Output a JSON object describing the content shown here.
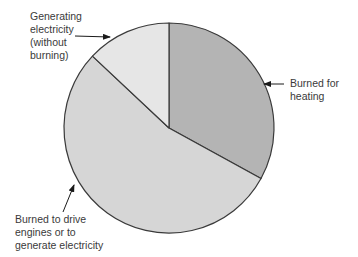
{
  "chart_data": {
    "type": "pie",
    "title": "",
    "categories": [
      "Burned for heating",
      "Burned to drive engines or to generate electricity",
      "Generating electricity (without burning)"
    ],
    "values": [
      33,
      54,
      13
    ],
    "units": "percent (estimated from slice angles)",
    "start_angle_deg": 0,
    "direction": "clockwise",
    "colors": [
      "#b4b4b4",
      "#d6d6d6",
      "#e6e6e6"
    ],
    "stroke_color": "#3a3a3a",
    "legend": "none (callout labels with arrows)",
    "annotations": [
      {
        "text": "Burned for\nheating",
        "points_to": "Burned for heating",
        "position": "right"
      },
      {
        "text": "Burned to drive\nengines or to\ngenerate electricity",
        "points_to": "Burned to drive engines or to generate electricity",
        "position": "bottom-left"
      },
      {
        "text": "Generating\nelectricity\n(without\nburning)",
        "points_to": "Generating electricity (without burning)",
        "position": "top-left"
      }
    ]
  },
  "labels": {
    "heating": "Burned for\nheating",
    "drive": "Burned to drive\nengines or to\ngenerate electricity",
    "generating": "Generating\nelectricity\n(without\nburning)"
  }
}
